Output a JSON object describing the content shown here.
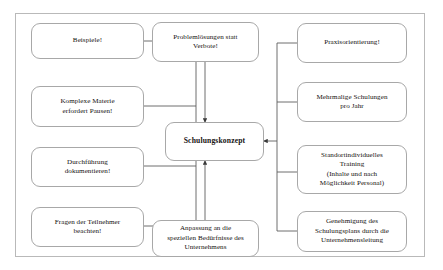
{
  "diagram": {
    "title": "Schulungskonzept",
    "type": "mind-map",
    "frame": {
      "border_color": "#b9b9b9"
    },
    "style": {
      "node_border_color": "#a8a8a8",
      "node_fill": "#ffffff",
      "connector_color": "#5e5e5e",
      "text_color": "#14110f"
    },
    "center_node": {
      "id": "center",
      "label": "Schulungskonzept",
      "bold": true
    },
    "left_nodes": [
      {
        "id": "left-1",
        "label": "Beispiele!"
      },
      {
        "id": "left-2",
        "label": "Komplexe Materie\nerfordert Pausen!"
      },
      {
        "id": "left-3",
        "label": "Durchführung\ndokumentieren!"
      },
      {
        "id": "left-4",
        "label": "Fragen der Teilnehmer\nbeachten!"
      }
    ],
    "top_node": {
      "id": "top-1",
      "label": "Problemlösungen statt\nVerbote!"
    },
    "bottom_node": {
      "id": "bottom-1",
      "label": "Anpassung an die\nspeziellen Bedürfnisse des\nUnternehmens"
    },
    "right_nodes": [
      {
        "id": "right-1",
        "label": "Praxisorientierung!"
      },
      {
        "id": "right-2",
        "label": "Mehrmalige Schulungen\npro Jahr"
      },
      {
        "id": "right-3",
        "label": "Standortindividuelles\nTraining\n(Inhalte und nach\nMöglichkeit Personal)"
      },
      {
        "id": "right-4",
        "label": "Genehmigung des\nSchulungsplans durch die\nUnternehmensleitung"
      }
    ]
  }
}
